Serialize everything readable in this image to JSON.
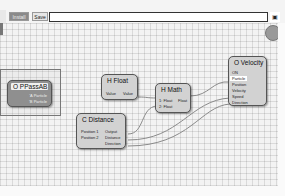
{
  "toolbar": {
    "install_label": "Install",
    "save_label": "Save",
    "path_value": "",
    "corner_icon": "mf-icon"
  },
  "nodes": {
    "ppassab": {
      "title": "O PPassAB",
      "ports": [
        "‘A Particle",
        "‘B Particle"
      ]
    },
    "float": {
      "title": "H Float",
      "inputs": [
        "Value"
      ],
      "outputs": [
        "Value"
      ]
    },
    "math": {
      "title": "H Math",
      "inputs": [
        "1: Float",
        "2: Float"
      ],
      "outputs": [
        "Float"
      ]
    },
    "distance": {
      "title": "C Distance",
      "inputs": [
        "Position 1",
        "Position 2"
      ],
      "outputs": [
        "Output",
        "Distance",
        "Direction"
      ]
    },
    "velocity": {
      "title": "O Velocity",
      "ports": [
        "ON",
        "Particle",
        "Position",
        "Velocity",
        "Speed",
        "Direction"
      ],
      "highlighted_port": "Particle"
    }
  },
  "colors": {
    "canvas": "#f3f3f3",
    "grid": "#d9d9d9",
    "node": "#d2d2d2",
    "node_dark": "#8f8f8f",
    "wire": "#8a8a8a"
  }
}
